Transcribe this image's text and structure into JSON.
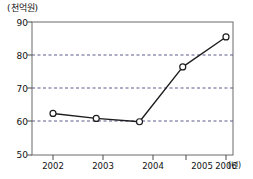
{
  "chart_data": {
    "type": "line",
    "title": "",
    "subtitle": "",
    "xlabel": "(년)",
    "ylabel": "(천억원)",
    "categories": [
      "2002",
      "2003",
      "2004",
      "2005",
      "2006"
    ],
    "values": [
      62.5,
      61.0,
      60.0,
      76.5,
      85.5
    ],
    "series": [
      {
        "name": "",
        "values": [
          62.5,
          61.0,
          60.0,
          76.5,
          85.5
        ]
      }
    ],
    "ylim": [
      50,
      90
    ],
    "yticks": [
      50,
      60,
      70,
      80,
      90
    ],
    "ytick_labels": [
      "50",
      "60",
      "70",
      "80",
      "90"
    ],
    "xtick_labels": [
      "2002",
      "2003",
      "2004",
      "2005",
      "2006"
    ],
    "grid": "horizontal-dashed",
    "gridlines_at": [
      60,
      70,
      80
    ],
    "legend": "none",
    "legend_position": "none",
    "marker": "open-circle",
    "line_color": "#1d1d1d",
    "grid_color": "#5a5a8c",
    "axis_color": "#6b6b6b",
    "background": "#ffffff"
  },
  "axis": {
    "y_unit": "(천억원)",
    "x_unit": "(년)"
  }
}
